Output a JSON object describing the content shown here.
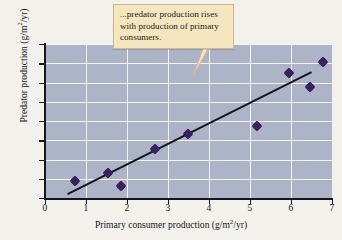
{
  "callout": {
    "text": "...predator production rises with production of primary consumers."
  },
  "chart_data": {
    "type": "scatter",
    "title": "",
    "xlabel": "Primary consumer production (g/m2/yr)",
    "ylabel": "Predator production (g/m2/yr)",
    "xlabel_parts": {
      "pre": "Primary consumer production (g/m",
      "sup": "2",
      "post": "/yr)"
    },
    "ylabel_parts": {
      "pre": "Predator production (g/m",
      "sup": "2",
      "post": "/yr)"
    },
    "xlim": [
      0,
      7
    ],
    "ylim": [
      0,
      4
    ],
    "xticks": [
      "0",
      "1",
      "2",
      "3",
      "4",
      "5",
      "6",
      "7"
    ],
    "yticks": [
      "0",
      "0.5",
      "1",
      "1.5",
      "2",
      "2.5",
      "3",
      "3.5",
      "4"
    ],
    "xtick_values": [
      0,
      1,
      2,
      3,
      4,
      5,
      6,
      7
    ],
    "ytick_values": [
      0,
      0.5,
      1,
      1.5,
      2,
      2.5,
      3,
      3.5,
      4
    ],
    "grid": true,
    "legend": null,
    "plot_background": "#aeb4c8",
    "grid_color": "#f3f3f6",
    "marker_color": "#3b2063",
    "marker_shape": "diamond",
    "line_color": "#15161c",
    "points": [
      {
        "x": 0.72,
        "y": 0.43
      },
      {
        "x": 1.54,
        "y": 0.64
      },
      {
        "x": 1.86,
        "y": 0.31
      },
      {
        "x": 2.68,
        "y": 1.26
      },
      {
        "x": 3.48,
        "y": 1.65
      },
      {
        "x": 5.18,
        "y": 1.88
      },
      {
        "x": 5.96,
        "y": 3.24
      },
      {
        "x": 6.47,
        "y": 2.89
      },
      {
        "x": 6.77,
        "y": 3.53
      }
    ],
    "trend_line": {
      "x0": 0.55,
      "y0": 0.1,
      "x1": 6.5,
      "y1": 3.27
    }
  }
}
